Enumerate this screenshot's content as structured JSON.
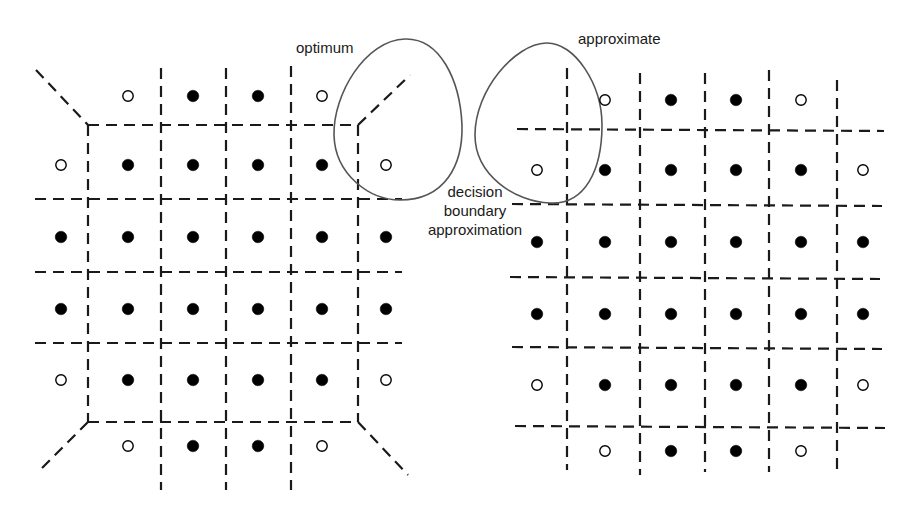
{
  "labels": {
    "optimum": "optimum",
    "approximate": "approximate",
    "decision_line1": "decision",
    "decision_line2": "boundary",
    "decision_line3": "approximation"
  },
  "colors": {
    "line": "#1a1a1a",
    "filled_point": "#000000",
    "hollow_point": "#ffffff",
    "blob_outline": "#555555"
  },
  "diagrams": [
    {
      "name": "optimum",
      "point_cols": [
        61,
        128,
        193,
        258,
        322,
        386
      ],
      "point_rows": [
        96,
        165,
        237,
        309,
        380,
        446
      ],
      "pattern": [
        [
          null,
          "o",
          "f",
          "f",
          "o",
          null
        ],
        [
          "o",
          "f",
          "f",
          "f",
          "f",
          "o"
        ],
        [
          "f",
          "f",
          "f",
          "f",
          "f",
          "f"
        ],
        [
          "f",
          "f",
          "f",
          "f",
          "f",
          "f"
        ],
        [
          "o",
          "f",
          "f",
          "f",
          "f",
          "o"
        ],
        [
          null,
          "o",
          "f",
          "f",
          "o",
          null
        ]
      ]
    },
    {
      "name": "approximate",
      "point_cols": [
        537,
        605,
        671,
        736,
        801,
        863
      ],
      "point_rows": [
        100,
        170,
        242,
        314,
        385,
        451
      ],
      "pattern": [
        [
          null,
          "o",
          "f",
          "f",
          "o",
          null
        ],
        [
          "o",
          "f",
          "f",
          "f",
          "f",
          "o"
        ],
        [
          "f",
          "f",
          "f",
          "f",
          "f",
          "f"
        ],
        [
          "f",
          "f",
          "f",
          "f",
          "f",
          "f"
        ],
        [
          "o",
          "f",
          "f",
          "f",
          "f",
          "o"
        ],
        [
          null,
          "o",
          "f",
          "f",
          "o",
          null
        ]
      ]
    }
  ]
}
